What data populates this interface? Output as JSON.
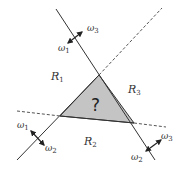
{
  "diagram": {
    "type": "decision-regions",
    "colors": {
      "line": "#333333",
      "triangle_fill": "#c4c4c4",
      "background": "#ffffff"
    },
    "regions": [
      {
        "id": "R1",
        "base": "R",
        "sub": "1"
      },
      {
        "id": "R2",
        "base": "R",
        "sub": "2"
      },
      {
        "id": "R3",
        "base": "R",
        "sub": "3"
      }
    ],
    "ambiguous_region": {
      "label": "?"
    },
    "boundaries": [
      {
        "name": "boundary-1-3",
        "side_a": {
          "base": "ω",
          "sub": "3"
        },
        "side_b": {
          "base": "ω",
          "sub": "1"
        }
      },
      {
        "name": "boundary-1-2",
        "side_a": {
          "base": "ω",
          "sub": "1"
        },
        "side_b": {
          "base": "ω",
          "sub": "2"
        }
      },
      {
        "name": "boundary-2-3",
        "side_a": {
          "base": "ω",
          "sub": "3"
        },
        "side_b": {
          "base": "ω",
          "sub": "2"
        }
      }
    ]
  }
}
